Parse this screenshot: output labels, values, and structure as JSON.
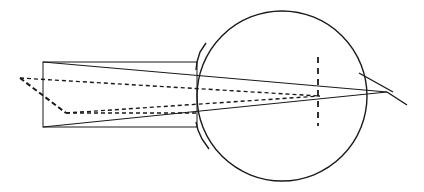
{
  "figure": {
    "type": "line-diagram",
    "canvas": {
      "width": 424,
      "height": 192,
      "background": "#ffffff"
    },
    "stroke_color": "#1a1a1a",
    "elements": [
      {
        "name": "incoming-beam-rectangle",
        "shape": "rectangle",
        "style": "solid",
        "stroke_width": 1,
        "x": 43,
        "y": 62,
        "width": 154,
        "height": 65
      },
      {
        "name": "eyeball-circle",
        "shape": "circle",
        "style": "solid",
        "stroke_width": 1.4,
        "cx": 282,
        "cy": 96,
        "r": 85
      },
      {
        "name": "cornea-notch-upper",
        "shape": "polyline",
        "style": "solid",
        "stroke_width": 1.4,
        "points": "206,43 200,52 197,62 196,70"
      },
      {
        "name": "cornea-notch-lower",
        "shape": "polyline",
        "style": "solid",
        "stroke_width": 1.4,
        "points": "196,122 198,130 202,139 209,149"
      },
      {
        "name": "ray-upper-solid",
        "shape": "line",
        "style": "solid",
        "stroke_width": 1.1,
        "x1": 43,
        "y1": 62,
        "x2": 387,
        "y2": 92
      },
      {
        "name": "ray-lower-solid",
        "shape": "line",
        "style": "solid",
        "stroke_width": 1.1,
        "x1": 43,
        "y1": 127,
        "x2": 387,
        "y2": 92
      },
      {
        "name": "ray-upper-dashed",
        "shape": "line",
        "style": "dashed",
        "stroke_width": 1.4,
        "dash": "4,3",
        "x1": 20,
        "y1": 78,
        "x2": 320,
        "y2": 96
      },
      {
        "name": "ray-lower-dashed",
        "shape": "line",
        "style": "dashed",
        "stroke_width": 1.4,
        "dash": "4,3",
        "x1": 66,
        "y1": 113,
        "x2": 320,
        "y2": 96
      },
      {
        "name": "aperture-edge-dashed",
        "shape": "line",
        "style": "dashed",
        "stroke_width": 2,
        "dash": "5,3",
        "x1": 20,
        "y1": 78,
        "x2": 66,
        "y2": 113
      },
      {
        "name": "aperture-base-dashed",
        "shape": "line",
        "style": "dashed",
        "stroke_width": 1.6,
        "dash": "4,3",
        "x1": 66,
        "y1": 113,
        "x2": 197,
        "y2": 113
      },
      {
        "name": "retina-plane-dashed",
        "shape": "line",
        "style": "dashed",
        "stroke_width": 1.8,
        "dash": "6,5",
        "x1": 318,
        "y1": 57,
        "x2": 318,
        "y2": 126
      },
      {
        "name": "exit-ray-upper",
        "shape": "line",
        "style": "solid",
        "stroke_width": 1.4,
        "x1": 359,
        "y1": 73,
        "x2": 393,
        "y2": 92
      },
      {
        "name": "exit-ray-lower",
        "shape": "line",
        "style": "solid",
        "stroke_width": 1.4,
        "x1": 387,
        "y1": 92,
        "x2": 407,
        "y2": 105
      }
    ]
  }
}
